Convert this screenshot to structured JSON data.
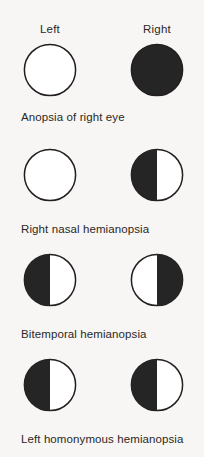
{
  "figure": {
    "background_color": "#f7f6f4",
    "fill_color": "#252525",
    "stroke_color": "#231f20",
    "empty_color": "#ffffff"
  },
  "headers": {
    "left_label": "Left",
    "right_label": "Right"
  },
  "rows": [
    {
      "caption": "Anopsia of right eye",
      "left_eye": {
        "name": "left-eye-field",
        "fill": "none"
      },
      "right_eye": {
        "name": "right-eye-field",
        "fill": "full"
      }
    },
    {
      "caption": "Right nasal hemianopsia",
      "left_eye": {
        "name": "left-eye-field",
        "fill": "none"
      },
      "right_eye": {
        "name": "right-eye-field",
        "fill": "left-half"
      }
    },
    {
      "caption": "Bitemporal hemianopsia",
      "left_eye": {
        "name": "left-eye-field",
        "fill": "left-half"
      },
      "right_eye": {
        "name": "right-eye-field",
        "fill": "right-half"
      }
    },
    {
      "caption": "Left homonymous hemianopsia",
      "left_eye": {
        "name": "left-eye-field",
        "fill": "left-half"
      },
      "right_eye": {
        "name": "right-eye-field",
        "fill": "left-half"
      }
    }
  ]
}
